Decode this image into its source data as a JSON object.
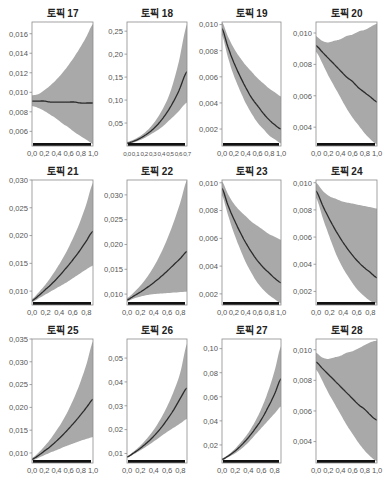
{
  "figure": {
    "layout": {
      "rows": 3,
      "cols": 4
    },
    "colors": {
      "band": "#a9a9a9",
      "line": "#2b2b2b",
      "axis": "#8c8c8c",
      "rug": "#111111",
      "text": "#555555",
      "title": "#222222"
    }
  },
  "chart_data": [
    {
      "type": "line",
      "title": "토픽 17",
      "xlabel": "",
      "ylabel": "",
      "xlim": [
        0,
        1.0
      ],
      "ylim": [
        0.0045,
        0.0172
      ],
      "xticks": [
        "0.0",
        "0.2",
        "0.4",
        "0.6",
        "0.8",
        "1.0"
      ],
      "yticks": [
        "0.006",
        "0.008",
        "0.010",
        "0.012",
        "0.014",
        "0.016"
      ],
      "ytick_values": [
        0.006,
        0.008,
        0.01,
        0.012,
        0.014,
        0.016
      ],
      "x": [
        0,
        0.1,
        0.2,
        0.3,
        0.4,
        0.5,
        0.6,
        0.7,
        0.8,
        0.9,
        1.0
      ],
      "series": [
        {
          "name": "estimate",
          "values": [
            0.0091,
            0.0091,
            0.0091,
            0.009,
            0.009,
            0.009,
            0.009,
            0.009,
            0.0089,
            0.0089,
            0.0089
          ]
        },
        {
          "name": "upper",
          "values": [
            0.0097,
            0.0098,
            0.0102,
            0.0107,
            0.0113,
            0.012,
            0.0128,
            0.0137,
            0.0147,
            0.0158,
            0.017
          ]
        },
        {
          "name": "lower",
          "values": [
            0.0086,
            0.0084,
            0.0081,
            0.0077,
            0.0073,
            0.0068,
            0.0064,
            0.0059,
            0.0055,
            0.0051,
            0.0047
          ]
        }
      ]
    },
    {
      "type": "line",
      "title": "토픽 18",
      "xlabel": "",
      "ylabel": "",
      "xlim": [
        0,
        0.7
      ],
      "ylim": [
        0,
        0.27
      ],
      "xticks": [
        "0.0",
        "0.1",
        "0.2",
        "0.3",
        "0.4",
        "0.5",
        "0.6",
        "0.7"
      ],
      "yticks": [
        "0.05",
        "0.10",
        "0.15",
        "0.20",
        "0.25"
      ],
      "ytick_values": [
        0.05,
        0.1,
        0.15,
        0.2,
        0.25
      ],
      "x": [
        0,
        0.1,
        0.2,
        0.3,
        0.4,
        0.5,
        0.6,
        0.7
      ],
      "series": [
        {
          "name": "estimate",
          "values": [
            0.006,
            0.012,
            0.022,
            0.036,
            0.056,
            0.083,
            0.118,
            0.162
          ]
        },
        {
          "name": "upper",
          "values": [
            0.009,
            0.016,
            0.028,
            0.047,
            0.075,
            0.115,
            0.18,
            0.265
          ]
        },
        {
          "name": "lower",
          "values": [
            0.004,
            0.009,
            0.017,
            0.028,
            0.04,
            0.057,
            0.075,
            0.095
          ]
        }
      ]
    },
    {
      "type": "line",
      "title": "토픽 19",
      "xlabel": "",
      "ylabel": "",
      "xlim": [
        0,
        1.0
      ],
      "ylim": [
        0.0007,
        0.0102
      ],
      "xticks": [
        "0.0",
        "0.2",
        "0.4",
        "0.6",
        "0.8",
        "1.0"
      ],
      "yticks": [
        "0.002",
        "0.004",
        "0.006",
        "0.008",
        "0.010"
      ],
      "ytick_values": [
        0.002,
        0.004,
        0.006,
        0.008,
        0.01
      ],
      "x": [
        0,
        0.1,
        0.2,
        0.3,
        0.4,
        0.5,
        0.6,
        0.7,
        0.8,
        0.9,
        1.0
      ],
      "series": [
        {
          "name": "estimate",
          "values": [
            0.0097,
            0.0083,
            0.0071,
            0.0061,
            0.0052,
            0.0044,
            0.0038,
            0.0032,
            0.0027,
            0.0023,
            0.002
          ]
        },
        {
          "name": "upper",
          "values": [
            0.0102,
            0.0091,
            0.0082,
            0.0075,
            0.0069,
            0.0064,
            0.0059,
            0.0055,
            0.0051,
            0.0048,
            0.0045
          ]
        },
        {
          "name": "lower",
          "values": [
            0.0092,
            0.0075,
            0.0061,
            0.005,
            0.004,
            0.0032,
            0.0025,
            0.002,
            0.0015,
            0.0012,
            0.0009
          ]
        }
      ]
    },
    {
      "type": "line",
      "title": "토픽 20",
      "xlabel": "",
      "ylabel": "",
      "xlim": [
        0,
        1.0
      ],
      "ylim": [
        0.0028,
        0.0107
      ],
      "xticks": [
        "0.0",
        "0.2",
        "0.4",
        "0.6",
        "0.8",
        "1.0"
      ],
      "yticks": [
        "0.004",
        "0.006",
        "0.008",
        "0.010"
      ],
      "ytick_values": [
        0.004,
        0.006,
        0.008,
        0.01
      ],
      "x": [
        0,
        0.1,
        0.2,
        0.3,
        0.4,
        0.5,
        0.6,
        0.7,
        0.8,
        0.9,
        1.0
      ],
      "series": [
        {
          "name": "estimate",
          "values": [
            0.0092,
            0.0088,
            0.0084,
            0.008,
            0.0076,
            0.0072,
            0.0069,
            0.0065,
            0.0062,
            0.0059,
            0.0056
          ]
        },
        {
          "name": "upper",
          "values": [
            0.0098,
            0.0095,
            0.0094,
            0.0095,
            0.0096,
            0.0098,
            0.0099,
            0.0101,
            0.0102,
            0.0104,
            0.0106
          ]
        },
        {
          "name": "lower",
          "values": [
            0.0088,
            0.0081,
            0.0073,
            0.0066,
            0.0059,
            0.0052,
            0.0046,
            0.0041,
            0.0036,
            0.0032,
            0.0029
          ]
        }
      ]
    },
    {
      "type": "line",
      "title": "토픽 21",
      "xlabel": "",
      "ylabel": "",
      "xlim": [
        0,
        0.9
      ],
      "ylim": [
        0.0075,
        0.03
      ],
      "xticks": [
        "0.0",
        "0.2",
        "0.4",
        "0.6",
        "0.8"
      ],
      "yticks": [
        "0.010",
        "0.015",
        "0.020",
        "0.025",
        "0.030"
      ],
      "ytick_values": [
        0.01,
        0.015,
        0.02,
        0.025,
        0.03
      ],
      "x": [
        0,
        0.1,
        0.2,
        0.3,
        0.4,
        0.5,
        0.6,
        0.7,
        0.8,
        0.9
      ],
      "series": [
        {
          "name": "estimate",
          "values": [
            0.0083,
            0.0092,
            0.0103,
            0.0114,
            0.0127,
            0.0141,
            0.0156,
            0.0172,
            0.019,
            0.0208
          ]
        },
        {
          "name": "upper",
          "values": [
            0.0086,
            0.0098,
            0.0112,
            0.0129,
            0.0148,
            0.0169,
            0.0194,
            0.0222,
            0.0256,
            0.0295
          ]
        },
        {
          "name": "lower",
          "values": [
            0.008,
            0.0087,
            0.0094,
            0.0101,
            0.0108,
            0.0115,
            0.0123,
            0.0131,
            0.0139,
            0.0146
          ]
        }
      ]
    },
    {
      "type": "line",
      "title": "토픽 22",
      "xlabel": "",
      "ylabel": "",
      "xlim": [
        0,
        0.9
      ],
      "ylim": [
        0.0078,
        0.033
      ],
      "xticks": [
        "0.0",
        "0.2",
        "0.4",
        "0.6",
        "0.8"
      ],
      "yticks": [
        "0.010",
        "0.015",
        "0.020",
        "0.025",
        "0.030"
      ],
      "ytick_values": [
        0.01,
        0.015,
        0.02,
        0.025,
        0.03
      ],
      "x": [
        0,
        0.1,
        0.2,
        0.3,
        0.4,
        0.5,
        0.6,
        0.7,
        0.8,
        0.9
      ],
      "series": [
        {
          "name": "estimate",
          "values": [
            0.0088,
            0.0096,
            0.0104,
            0.0113,
            0.0123,
            0.0134,
            0.0146,
            0.0159,
            0.0172,
            0.0186
          ]
        },
        {
          "name": "upper",
          "values": [
            0.0092,
            0.0103,
            0.0117,
            0.0134,
            0.0155,
            0.018,
            0.021,
            0.0245,
            0.0285,
            0.033
          ]
        },
        {
          "name": "lower",
          "values": [
            0.0085,
            0.0091,
            0.0095,
            0.0098,
            0.01,
            0.0101,
            0.0102,
            0.0103,
            0.0104,
            0.0105
          ]
        }
      ]
    },
    {
      "type": "line",
      "title": "토픽 23",
      "xlabel": "",
      "ylabel": "",
      "xlim": [
        0,
        1.0
      ],
      "ylim": [
        0.0012,
        0.0102
      ],
      "xticks": [
        "0.0",
        "0.2",
        "0.4",
        "0.6",
        "0.8",
        "1.0"
      ],
      "yticks": [
        "0.002",
        "0.004",
        "0.006",
        "0.008",
        "0.010"
      ],
      "ytick_values": [
        0.002,
        0.004,
        0.006,
        0.008,
        0.01
      ],
      "x": [
        0,
        0.1,
        0.2,
        0.3,
        0.4,
        0.5,
        0.6,
        0.7,
        0.8,
        0.9,
        1.0
      ],
      "series": [
        {
          "name": "estimate",
          "values": [
            0.0096,
            0.0084,
            0.0074,
            0.0065,
            0.0057,
            0.005,
            0.0044,
            0.0039,
            0.0035,
            0.0031,
            0.0028
          ]
        },
        {
          "name": "upper",
          "values": [
            0.0101,
            0.0092,
            0.0085,
            0.008,
            0.0076,
            0.0072,
            0.0069,
            0.0066,
            0.0063,
            0.0061,
            0.0059
          ]
        },
        {
          "name": "lower",
          "values": [
            0.0091,
            0.0077,
            0.0064,
            0.0053,
            0.0043,
            0.0035,
            0.0028,
            0.0023,
            0.0019,
            0.0016,
            0.0013
          ]
        }
      ]
    },
    {
      "type": "line",
      "title": "토픽 24",
      "xlabel": "",
      "ylabel": "",
      "xlim": [
        0,
        0.9
      ],
      "ylim": [
        0.001,
        0.0102
      ],
      "xticks": [
        "0.0",
        "0.2",
        "0.4",
        "0.6",
        "0.8"
      ],
      "yticks": [
        "0.002",
        "0.004",
        "0.006",
        "0.008",
        "0.010"
      ],
      "ytick_values": [
        0.002,
        0.004,
        0.006,
        0.008,
        0.01
      ],
      "x": [
        0,
        0.1,
        0.2,
        0.3,
        0.4,
        0.5,
        0.6,
        0.7,
        0.8,
        0.9
      ],
      "series": [
        {
          "name": "estimate",
          "values": [
            0.0094,
            0.0083,
            0.0073,
            0.0064,
            0.0056,
            0.0049,
            0.0043,
            0.0038,
            0.0034,
            0.003
          ]
        },
        {
          "name": "upper",
          "values": [
            0.01,
            0.0094,
            0.009,
            0.0088,
            0.0086,
            0.0085,
            0.0084,
            0.0083,
            0.0082,
            0.0081
          ]
        },
        {
          "name": "lower",
          "values": [
            0.0089,
            0.0074,
            0.006,
            0.0047,
            0.0037,
            0.0029,
            0.0022,
            0.0017,
            0.0013,
            0.0011
          ]
        }
      ]
    },
    {
      "type": "line",
      "title": "토픽 25",
      "xlabel": "",
      "ylabel": "",
      "xlim": [
        0,
        1.0
      ],
      "ylim": [
        0.0078,
        0.035
      ],
      "xticks": [
        "0.0",
        "0.2",
        "0.4",
        "0.6",
        "0.8",
        "1.0"
      ],
      "yticks": [
        "0.010",
        "0.015",
        "0.020",
        "0.025",
        "0.030",
        "0.035"
      ],
      "ytick_values": [
        0.01,
        0.015,
        0.02,
        0.025,
        0.03,
        0.035
      ],
      "x": [
        0,
        0.1,
        0.2,
        0.3,
        0.4,
        0.5,
        0.6,
        0.7,
        0.8,
        0.9,
        1.0
      ],
      "series": [
        {
          "name": "estimate",
          "values": [
            0.0086,
            0.0094,
            0.0104,
            0.0114,
            0.0126,
            0.0139,
            0.0153,
            0.0168,
            0.0184,
            0.0201,
            0.0218
          ]
        },
        {
          "name": "upper",
          "values": [
            0.0089,
            0.01,
            0.0114,
            0.013,
            0.0149,
            0.017,
            0.0195,
            0.0224,
            0.0258,
            0.0298,
            0.0345
          ]
        },
        {
          "name": "lower",
          "values": [
            0.0083,
            0.0089,
            0.0095,
            0.0101,
            0.0106,
            0.0112,
            0.0117,
            0.0122,
            0.0127,
            0.0131,
            0.0135
          ]
        }
      ]
    },
    {
      "type": "line",
      "title": "토픽 26",
      "xlabel": "",
      "ylabel": "",
      "xlim": [
        0,
        0.9
      ],
      "ylim": [
        0.006,
        0.058
      ],
      "xticks": [
        "0.0",
        "0.2",
        "0.4",
        "0.6",
        "0.8"
      ],
      "yticks": [
        "0.01",
        "0.02",
        "0.03",
        "0.04",
        "0.05"
      ],
      "ytick_values": [
        0.01,
        0.02,
        0.03,
        0.04,
        0.05
      ],
      "x": [
        0,
        0.1,
        0.2,
        0.3,
        0.4,
        0.5,
        0.6,
        0.7,
        0.8,
        0.9
      ],
      "series": [
        {
          "name": "estimate",
          "values": [
            0.0085,
            0.0102,
            0.0122,
            0.0145,
            0.0172,
            0.0204,
            0.0241,
            0.0283,
            0.0331,
            0.0375
          ]
        },
        {
          "name": "upper",
          "values": [
            0.0088,
            0.0108,
            0.0133,
            0.0163,
            0.0199,
            0.0243,
            0.0296,
            0.036,
            0.044,
            0.056
          ]
        },
        {
          "name": "lower",
          "values": [
            0.0082,
            0.0097,
            0.0113,
            0.0131,
            0.015,
            0.017,
            0.019,
            0.0208,
            0.0226,
            0.0245
          ]
        }
      ]
    },
    {
      "type": "line",
      "title": "토픽 27",
      "xlabel": "",
      "ylabel": "",
      "xlim": [
        0,
        0.9
      ],
      "ylim": [
        0.005,
        0.108
      ],
      "xticks": [
        "0.0",
        "0.2",
        "0.4",
        "0.6",
        "0.8"
      ],
      "yticks": [
        "0.02",
        "0.04",
        "0.06",
        "0.08",
        "0.10"
      ],
      "ytick_values": [
        0.02,
        0.04,
        0.06,
        0.08,
        0.1
      ],
      "x": [
        0,
        0.1,
        0.2,
        0.3,
        0.4,
        0.5,
        0.6,
        0.7,
        0.8,
        0.9
      ],
      "series": [
        {
          "name": "estimate",
          "values": [
            0.008,
            0.011,
            0.015,
            0.02,
            0.026,
            0.033,
            0.041,
            0.051,
            0.062,
            0.075
          ]
        },
        {
          "name": "upper",
          "values": [
            0.009,
            0.012,
            0.017,
            0.023,
            0.03,
            0.039,
            0.05,
            0.064,
            0.081,
            0.102
          ]
        },
        {
          "name": "lower",
          "values": [
            0.007,
            0.01,
            0.013,
            0.017,
            0.022,
            0.028,
            0.034,
            0.04,
            0.046,
            0.052
          ]
        }
      ]
    },
    {
      "type": "line",
      "title": "토픽 28",
      "xlabel": "",
      "ylabel": "",
      "xlim": [
        0,
        1.0
      ],
      "ylim": [
        0.0026,
        0.0107
      ],
      "xticks": [
        "0.0",
        "0.2",
        "0.4",
        "0.6",
        "0.8",
        "1.0"
      ],
      "yticks": [
        "0.004",
        "0.006",
        "0.008",
        "0.010"
      ],
      "ytick_values": [
        0.004,
        0.006,
        0.008,
        0.01
      ],
      "x": [
        0,
        0.1,
        0.2,
        0.3,
        0.4,
        0.5,
        0.6,
        0.7,
        0.8,
        0.9,
        1.0
      ],
      "series": [
        {
          "name": "estimate",
          "values": [
            0.0092,
            0.0088,
            0.0084,
            0.008,
            0.0076,
            0.0072,
            0.0068,
            0.0064,
            0.0061,
            0.0057,
            0.0054
          ]
        },
        {
          "name": "upper",
          "values": [
            0.0098,
            0.0095,
            0.0094,
            0.0095,
            0.0096,
            0.0098,
            0.0099,
            0.0101,
            0.0103,
            0.0105,
            0.0106
          ]
        },
        {
          "name": "lower",
          "values": [
            0.0087,
            0.008,
            0.0072,
            0.0065,
            0.0058,
            0.0051,
            0.0045,
            0.0039,
            0.0034,
            0.003,
            0.0027
          ]
        }
      ]
    }
  ]
}
